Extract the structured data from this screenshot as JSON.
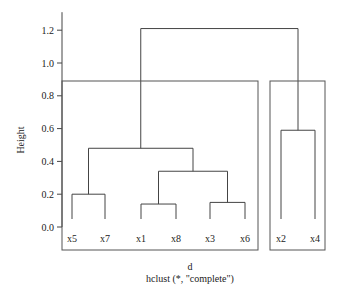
{
  "chart_data": {
    "type": "dendrogram",
    "title": "",
    "xlabel": "d",
    "sub": "hclust (*, \"complete\")",
    "ylabel": "Height",
    "ylim": [
      0,
      1.3
    ],
    "yticks": [
      0.0,
      0.2,
      0.4,
      0.6,
      0.8,
      1.0,
      1.2
    ],
    "ytick_labels": [
      "0.0",
      "0.2",
      "0.4",
      "0.6",
      "0.8",
      "1.0",
      "1.2"
    ],
    "leaves": [
      "x5",
      "x7",
      "x1",
      "x8",
      "x3",
      "x6",
      "x2",
      "x4"
    ],
    "merges": [
      {
        "left": "x5",
        "right": "x7",
        "height": 0.2
      },
      {
        "left": "x1",
        "right": "x8",
        "height": 0.14
      },
      {
        "left": "x3",
        "right": "x6",
        "height": 0.15
      },
      {
        "left": "(x1,x8)",
        "right": "(x3,x6)",
        "height": 0.34
      },
      {
        "left": "(x5,x7)",
        "right": "(x1,x8,x3,x6)",
        "height": 0.48
      },
      {
        "left": "x2",
        "right": "x4",
        "height": 0.59
      },
      {
        "left": "(x5,x7,x1,x8,x3,x6)",
        "right": "(x2,x4)",
        "height": 1.21
      }
    ],
    "cluster_boxes": [
      {
        "members": [
          "x5",
          "x7",
          "x1",
          "x8",
          "x3",
          "x6"
        ]
      },
      {
        "members": [
          "x2",
          "x4"
        ]
      }
    ],
    "grid": false,
    "legend": null
  }
}
